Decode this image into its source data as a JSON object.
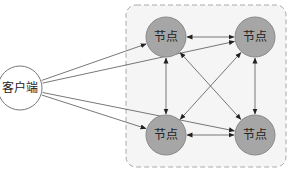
{
  "diagram": {
    "client": {
      "label": "客户端",
      "cx": 20,
      "cy": 88,
      "r": 22,
      "fill": "#ffffff",
      "stroke": "#777777"
    },
    "cluster": {
      "x": 126,
      "y": 5,
      "w": 160,
      "h": 162,
      "fill": "#f5f5f5",
      "stroke": "#aaaaaa"
    },
    "nodes": [
      {
        "id": "n1",
        "label": "节点",
        "cx": 166,
        "cy": 37,
        "r": 20
      },
      {
        "id": "n2",
        "label": "节点",
        "cx": 255,
        "cy": 37,
        "r": 20
      },
      {
        "id": "n3",
        "label": "节点",
        "cx": 166,
        "cy": 135,
        "r": 20
      },
      {
        "id": "n4",
        "label": "节点",
        "cx": 255,
        "cy": 135,
        "r": 20
      }
    ],
    "node_fill": "#a6a6a6",
    "node_stroke": "#8a8a8a",
    "edges": [
      {
        "from": "client",
        "to": "n1",
        "dir": "forward"
      },
      {
        "from": "client",
        "to": "n2",
        "dir": "forward"
      },
      {
        "from": "client",
        "to": "n3",
        "dir": "forward"
      },
      {
        "from": "client",
        "to": "n4",
        "dir": "forward"
      },
      {
        "from": "n1",
        "to": "n2",
        "dir": "both"
      },
      {
        "from": "n3",
        "to": "n4",
        "dir": "both"
      },
      {
        "from": "n1",
        "to": "n3",
        "dir": "both"
      },
      {
        "from": "n2",
        "to": "n4",
        "dir": "both"
      },
      {
        "from": "n1",
        "to": "n4",
        "dir": "both"
      },
      {
        "from": "n3",
        "to": "n2",
        "dir": "both"
      }
    ]
  }
}
